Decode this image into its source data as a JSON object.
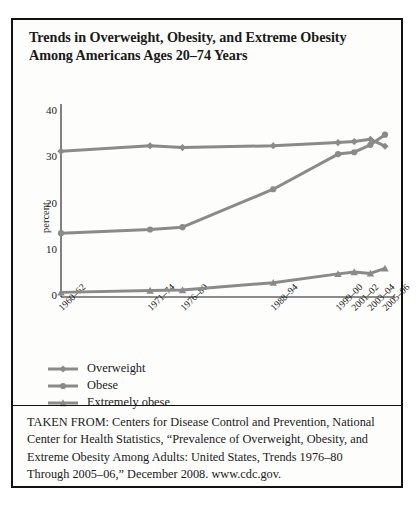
{
  "title": "Trends in Overweight, Obesity, and Extreme Obesity Among Americans Ages 20–74 Years",
  "source_note": "TAKEN FROM: Centers for Disease Control and Prevention, National Center for Health Statistics, “Prevalence of Overweight, Obesity, and Extreme Obesity Among Adults: United States, Trends 1976–80 Through 2005–06,” December 2008. www.cdc.gov.",
  "colors": {
    "line": "#8a8a8a",
    "axis": "#1a1a1a",
    "frame": "#111111",
    "background": "#fdfdfc"
  },
  "chart_data": {
    "type": "line",
    "title": "Trends in Overweight, Obesity, and Extreme Obesity Among Americans Ages 20–74 Years",
    "xlabel": "",
    "ylabel": "percent",
    "ylim": [
      0,
      40
    ],
    "yticks": [
      0,
      10,
      20,
      30,
      40
    ],
    "grid": false,
    "legend_position": "below-left",
    "categories": [
      "1960–62",
      "1971–74",
      "1976–80",
      "1988–94",
      "1999–00",
      "2001–02",
      "2003–04",
      "2005–06"
    ],
    "series": [
      {
        "name": "Overweight",
        "marker": "diamond",
        "values": [
          31.5,
          32.7,
          32.3,
          32.7,
          33.4,
          33.6,
          34.1,
          32.6
        ]
      },
      {
        "name": "Obese",
        "marker": "circle",
        "values": [
          13.8,
          14.6,
          15.1,
          23.3,
          30.9,
          31.3,
          32.9,
          35.1
        ]
      },
      {
        "name": "Extremely obese",
        "marker": "triangle",
        "values": [
          1.0,
          1.4,
          1.5,
          3.1,
          5.0,
          5.4,
          5.1,
          6.2
        ]
      }
    ]
  },
  "legend": [
    {
      "label": "Overweight",
      "marker": "diamond"
    },
    {
      "label": "Obese",
      "marker": "circle"
    },
    {
      "label": "Extremely obese",
      "marker": "triangle"
    }
  ]
}
